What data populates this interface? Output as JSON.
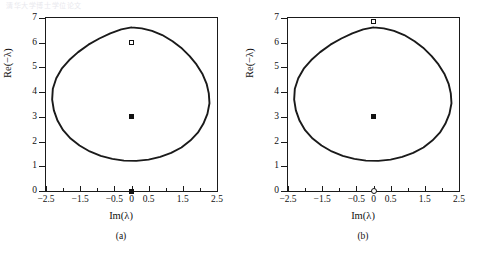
{
  "page": {
    "bleed_text_top": "清华大学博士学位论文",
    "background_color": "#ffffff",
    "curve_color": "#1a1a1a"
  },
  "figures": [
    {
      "id": "a",
      "subcaption": "(a)",
      "chart_data": {
        "type": "line",
        "title": "",
        "subtitle": "",
        "xlabel": "Im(λ)",
        "ylabel": "Re(−λ)",
        "xlim": [
          -2.5,
          2.5
        ],
        "ylim": [
          0,
          7
        ],
        "xticks": [
          -2.5,
          -2,
          -1.5,
          -1,
          -0.5,
          0,
          0.5,
          1,
          1.5,
          2,
          2.5
        ],
        "xtick_labels": [
          "−2.5",
          "−1.5",
          "−0.5",
          "0",
          "0.5",
          "1.5",
          "2.5"
        ],
        "xtick_labeled_values": [
          -2.5,
          -1.5,
          -0.5,
          0,
          0.5,
          1.5,
          2.5
        ],
        "yticks": [
          0,
          1,
          2,
          3,
          4,
          5,
          6,
          7
        ],
        "ytick_labels": [
          "0",
          "1",
          "2",
          "3",
          "4",
          "5",
          "6",
          "7"
        ],
        "grid": false,
        "legend": "none",
        "series": [
          {
            "name": "stability-boundary",
            "kind": "closed-curve",
            "description": "closed oval stability boundary",
            "center": [
              0.0,
              3.95
            ],
            "x_extent": [
              -2.32,
              2.28
            ],
            "y_extent": [
              1.22,
              6.62
            ],
            "points": [
              [
                0.0,
                6.62
              ],
              [
                0.3,
                6.58
              ],
              [
                0.6,
                6.48
              ],
              [
                0.9,
                6.31
              ],
              [
                1.2,
                6.06
              ],
              [
                1.45,
                5.8
              ],
              [
                1.7,
                5.46
              ],
              [
                1.9,
                5.12
              ],
              [
                2.08,
                4.72
              ],
              [
                2.2,
                4.32
              ],
              [
                2.26,
                3.95
              ],
              [
                2.28,
                3.55
              ],
              [
                2.22,
                3.12
              ],
              [
                2.1,
                2.72
              ],
              [
                1.94,
                2.36
              ],
              [
                1.72,
                2.04
              ],
              [
                1.46,
                1.76
              ],
              [
                1.16,
                1.54
              ],
              [
                0.84,
                1.38
              ],
              [
                0.5,
                1.27
              ],
              [
                0.14,
                1.22
              ],
              [
                -0.22,
                1.23
              ],
              [
                -0.56,
                1.3
              ],
              [
                -0.9,
                1.42
              ],
              [
                -1.22,
                1.6
              ],
              [
                -1.52,
                1.84
              ],
              [
                -1.78,
                2.12
              ],
              [
                -2.0,
                2.46
              ],
              [
                -2.16,
                2.84
              ],
              [
                -2.27,
                3.26
              ],
              [
                -2.32,
                3.7
              ],
              [
                -2.3,
                4.14
              ],
              [
                -2.2,
                4.56
              ],
              [
                -2.04,
                4.95
              ],
              [
                -1.82,
                5.3
              ],
              [
                -1.56,
                5.62
              ],
              [
                -1.26,
                5.92
              ],
              [
                -0.94,
                6.17
              ],
              [
                -0.62,
                6.38
              ],
              [
                -0.3,
                6.54
              ],
              [
                0.0,
                6.62
              ]
            ]
          }
        ],
        "markers": [
          {
            "name": "open-square-marker",
            "style": "open-square",
            "x": 0.0,
            "y": 6.0
          },
          {
            "name": "filled-square-marker",
            "style": "filled-square",
            "x": 0.0,
            "y": 3.0
          },
          {
            "name": "origin-marker",
            "style": "filled-square",
            "x": 0.0,
            "y": 0.0
          }
        ]
      }
    },
    {
      "id": "b",
      "subcaption": "(b)",
      "chart_data": {
        "type": "line",
        "title": "",
        "subtitle": "",
        "xlabel": "Im(λ)",
        "ylabel": "Re(−λ)",
        "xlim": [
          -2.5,
          2.5
        ],
        "ylim": [
          0,
          7
        ],
        "xticks": [
          -2.5,
          -2,
          -1.5,
          -1,
          -0.5,
          0,
          0.5,
          1,
          1.5,
          2,
          2.5
        ],
        "xtick_labels": [
          "−2.5",
          "−1.5",
          "−0.5",
          "0",
          "0.5",
          "1.5",
          "2.5"
        ],
        "xtick_labeled_values": [
          -2.5,
          -1.5,
          -0.5,
          0,
          0.5,
          1.5,
          2.5
        ],
        "yticks": [
          0,
          1,
          2,
          3,
          4,
          5,
          6,
          7
        ],
        "ytick_labels": [
          "0",
          "1",
          "2",
          "3",
          "4",
          "5",
          "6",
          "7"
        ],
        "grid": false,
        "legend": "none",
        "series": [
          {
            "name": "stability-boundary",
            "kind": "closed-curve",
            "description": "closed oval stability boundary",
            "center": [
              0.0,
              3.95
            ],
            "x_extent": [
              -2.32,
              2.28
            ],
            "y_extent": [
              1.22,
              6.62
            ],
            "points": [
              [
                0.0,
                6.62
              ],
              [
                0.3,
                6.58
              ],
              [
                0.6,
                6.48
              ],
              [
                0.9,
                6.31
              ],
              [
                1.2,
                6.06
              ],
              [
                1.45,
                5.8
              ],
              [
                1.7,
                5.46
              ],
              [
                1.9,
                5.12
              ],
              [
                2.08,
                4.72
              ],
              [
                2.2,
                4.32
              ],
              [
                2.26,
                3.95
              ],
              [
                2.28,
                3.55
              ],
              [
                2.22,
                3.12
              ],
              [
                2.1,
                2.72
              ],
              [
                1.94,
                2.36
              ],
              [
                1.72,
                2.04
              ],
              [
                1.46,
                1.76
              ],
              [
                1.16,
                1.54
              ],
              [
                0.84,
                1.38
              ],
              [
                0.5,
                1.27
              ],
              [
                0.14,
                1.22
              ],
              [
                -0.22,
                1.23
              ],
              [
                -0.56,
                1.3
              ],
              [
                -0.9,
                1.42
              ],
              [
                -1.22,
                1.6
              ],
              [
                -1.52,
                1.84
              ],
              [
                -1.78,
                2.12
              ],
              [
                -2.0,
                2.46
              ],
              [
                -2.16,
                2.84
              ],
              [
                -2.27,
                3.26
              ],
              [
                -2.32,
                3.7
              ],
              [
                -2.3,
                4.14
              ],
              [
                -2.2,
                4.56
              ],
              [
                -2.04,
                4.95
              ],
              [
                -1.82,
                5.3
              ],
              [
                -1.56,
                5.62
              ],
              [
                -1.26,
                5.92
              ],
              [
                -0.94,
                6.17
              ],
              [
                -0.62,
                6.38
              ],
              [
                -0.3,
                6.54
              ],
              [
                0.0,
                6.62
              ]
            ]
          }
        ],
        "markers": [
          {
            "name": "open-square-marker",
            "style": "open-square",
            "x": 0.0,
            "y": 6.85
          },
          {
            "name": "filled-square-marker",
            "style": "filled-square",
            "x": 0.0,
            "y": 3.0
          },
          {
            "name": "origin-marker",
            "style": "open-circle",
            "x": 0.0,
            "y": 0.0
          }
        ]
      }
    }
  ]
}
